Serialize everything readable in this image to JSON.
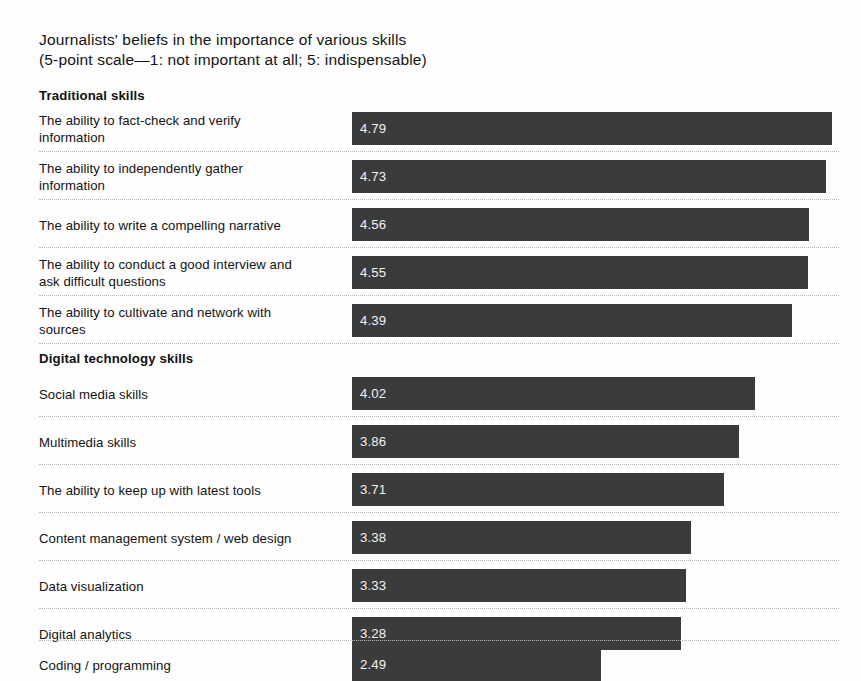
{
  "chart_data": {
    "type": "bar",
    "title": "Journalists' beliefs in the importance of various skills",
    "subtitle": "(5-point scale—1: not important at all; 5: indispensable)",
    "orientation": "horizontal",
    "xlabel": "",
    "ylabel": "",
    "xlim": [
      0,
      5
    ],
    "grid": false,
    "legend": null,
    "value_format": "two-decimal",
    "sections": [
      {
        "name": "Traditional skills",
        "categories": [
          "The ability to fact-check and verify information",
          "The ability to independently gather information",
          "The ability to write a compelling narrative",
          "The ability to conduct a good interview and ask difficult questions",
          "The ability to cultivate and network with sources"
        ],
        "values": [
          4.79,
          4.73,
          4.56,
          4.55,
          4.39
        ]
      },
      {
        "name": "Digital technology skills",
        "categories": [
          "Social media skills",
          "Multimedia skills",
          "The ability to keep up with latest tools",
          "Content management system / web design",
          "Data visualization",
          "Digital analytics",
          "Coding / programming"
        ],
        "values": [
          4.02,
          3.86,
          3.71,
          3.38,
          3.33,
          3.28,
          2.49
        ]
      }
    ],
    "categories": [
      "The ability to fact-check and verify information",
      "The ability to independently gather information",
      "The ability to write a compelling narrative",
      "The ability to conduct a good interview and ask difficult questions",
      "The ability to cultivate and network with sources",
      "Social media skills",
      "Multimedia skills",
      "The ability to keep up with latest tools",
      "Content management system / web design",
      "Data visualization",
      "Digital analytics",
      "Coding / programming"
    ],
    "values": [
      4.79,
      4.73,
      4.56,
      4.55,
      4.39,
      4.02,
      3.86,
      3.71,
      3.38,
      3.33,
      3.28,
      2.49
    ]
  },
  "title": {
    "line1": "Journalists' beliefs in the importance of various skills",
    "line2": "(5-point scale—1: not important at all; 5: indispensable)"
  },
  "sections": {
    "traditional": {
      "header": "Traditional skills"
    },
    "digital": {
      "header": "Digital technology skills"
    }
  },
  "rows": [
    {
      "label_line1": "The ability to fact-check and verify",
      "label_line2": "information",
      "value": "4.79",
      "value_num": 4.79
    },
    {
      "label_line1": "The ability to independently gather",
      "label_line2": "information",
      "value": "4.73",
      "value_num": 4.73
    },
    {
      "label_line1": "The ability to write a compelling narrative",
      "label_line2": "",
      "value": "4.56",
      "value_num": 4.56
    },
    {
      "label_line1": "The ability to conduct a good interview and",
      "label_line2": "ask difficult questions",
      "value": "4.55",
      "value_num": 4.55
    },
    {
      "label_line1": "The ability to cultivate and network with",
      "label_line2": "sources",
      "value": "4.39",
      "value_num": 4.39
    },
    {
      "label_line1": "Social media skills",
      "label_line2": "",
      "value": "4.02",
      "value_num": 4.02
    },
    {
      "label_line1": "Multimedia skills",
      "label_line2": "",
      "value": "3.86",
      "value_num": 3.86
    },
    {
      "label_line1": "The ability to keep up with latest tools",
      "label_line2": "",
      "value": "3.71",
      "value_num": 3.71
    },
    {
      "label_line1": "Content management system / web design",
      "label_line2": "",
      "value": "3.38",
      "value_num": 3.38
    },
    {
      "label_line1": "Data visualization",
      "label_line2": "",
      "value": "3.33",
      "value_num": 3.33
    },
    {
      "label_line1": "Digital analytics",
      "label_line2": "",
      "value": "3.28",
      "value_num": 3.28
    },
    {
      "label_line1": "Coding / programming",
      "label_line2": "",
      "value": "2.49",
      "value_num": 2.49
    }
  ],
  "colors": {
    "bar": "#3b3b3b",
    "bar_value_text": "#f2f2f2",
    "label_text": "#141414",
    "separator": "#b9b9b9",
    "background": "#fdfdfd"
  }
}
